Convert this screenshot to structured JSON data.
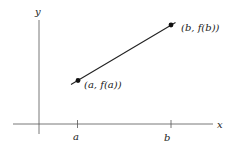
{
  "diagram": {
    "axes": {
      "x_label": "x",
      "y_label": "y"
    },
    "ticks": [
      {
        "label": "a"
      },
      {
        "label": "b"
      }
    ],
    "points": [
      {
        "label": "(a, f(a))",
        "x_symbol": "a",
        "fx_text": "f(a)"
      },
      {
        "label": "(b, f(b))",
        "x_symbol": "b",
        "fx_text": "f(b)"
      }
    ],
    "colors": {
      "axis": "#555555",
      "line": "#222222",
      "point": "#111111",
      "text": "#222222",
      "background": "#ffffff"
    }
  }
}
